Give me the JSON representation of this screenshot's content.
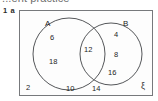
{
  "page": {
    "header_partial_text": "...ent practice",
    "question_label": "1 a",
    "width": 158,
    "height": 101
  },
  "diagram": {
    "type": "venn",
    "universal_set_symbol": "ξ",
    "set_a_label": "A",
    "set_b_label": "B",
    "regions": {
      "a_only": [
        "6",
        "18"
      ],
      "intersection": [
        "12"
      ],
      "b_only": [
        "4",
        "8",
        "16"
      ],
      "outside": [
        "2",
        "10",
        "14"
      ]
    },
    "colors": {
      "stroke": "#55575a",
      "box_stroke": "#77797c",
      "text": "#1e1e1e",
      "background": "#fdfdfd"
    }
  },
  "labels": {
    "a_only_top": "6",
    "a_only_bottom": "18",
    "intersection": "12",
    "b_only_top": "4",
    "b_only_mid": "8",
    "b_only_bottom": "16",
    "outside_left": "2",
    "outside_mid_left": "10",
    "outside_mid_right": "14"
  }
}
